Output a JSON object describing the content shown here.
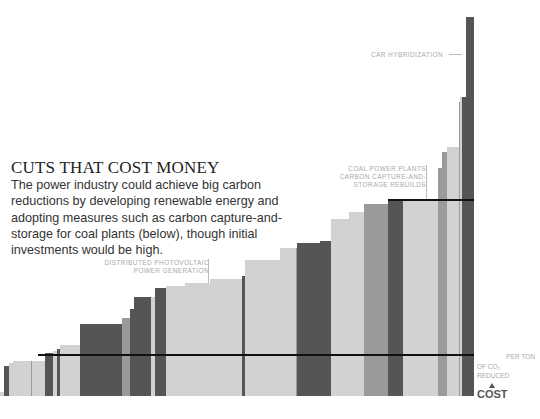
{
  "header": {
    "title": "CUTS THAT COST MONEY",
    "body": "The power industry could achieve big carbon reductions by developing renewable energy and adopting measures such as carbon capture-and-storage for coal plants (below), though initial investments would be high."
  },
  "annotations": {
    "car_hybridization": "CAR HYBRIDIZATION",
    "coal_line1": "COAL POWER PLANTS",
    "coal_line2": "CARBON CAPTURE-AND-",
    "coal_line3": "STORAGE REBUILDS",
    "pv_line1": "DISTRIBUTED PHOTOVOLTAIC",
    "pv_line2": "POWER GENERATION",
    "per_ton_line1": "PER TON",
    "per_ton_line2": "OF CO₂",
    "per_ton_line3": "REDUCED",
    "cost_label": "COST"
  },
  "colors": {
    "light": "#d2d2d2",
    "mid": "#9a9a9a",
    "dark": "#555555",
    "line": "#111111"
  },
  "chart_data": {
    "type": "bar",
    "subtype": "step (marginal abatement cost curve)",
    "title": "CUTS THAT COST MONEY",
    "xlabel": "",
    "ylabel": "COST per ton of CO2 reduced",
    "grid": false,
    "legend": "none",
    "bars_px": [
      {
        "x0": 0,
        "x1": 4,
        "top": 392,
        "shade": "light"
      },
      {
        "x0": 4,
        "x1": 9,
        "top": 366,
        "shade": "dark"
      },
      {
        "x0": 9,
        "x1": 13,
        "top": 363,
        "shade": "light"
      },
      {
        "x0": 13,
        "x1": 31,
        "top": 361,
        "shade": "light"
      },
      {
        "x0": 31,
        "x1": 32,
        "top": 361,
        "shade": "mid"
      },
      {
        "x0": 32,
        "x1": 45,
        "top": 361,
        "shade": "light"
      },
      {
        "x0": 45,
        "x1": 53,
        "top": 353,
        "shade": "dark"
      },
      {
        "x0": 53,
        "x1": 57,
        "top": 351,
        "shade": "light"
      },
      {
        "x0": 57,
        "x1": 60,
        "top": 349,
        "shade": "dark"
      },
      {
        "x0": 60,
        "x1": 80,
        "top": 345,
        "shade": "light"
      },
      {
        "x0": 80,
        "x1": 122,
        "top": 324,
        "shade": "dark"
      },
      {
        "x0": 122,
        "x1": 130,
        "top": 318,
        "shade": "mid"
      },
      {
        "x0": 130,
        "x1": 134,
        "top": 309,
        "shade": "dark"
      },
      {
        "x0": 134,
        "x1": 151,
        "top": 297,
        "shade": "dark"
      },
      {
        "x0": 151,
        "x1": 155,
        "top": 297,
        "shade": "light"
      },
      {
        "x0": 155,
        "x1": 166,
        "top": 288,
        "shade": "dark"
      },
      {
        "x0": 166,
        "x1": 185,
        "top": 286,
        "shade": "light"
      },
      {
        "x0": 185,
        "x1": 210,
        "top": 283,
        "shade": "light"
      },
      {
        "x0": 210,
        "x1": 242,
        "top": 279,
        "shade": "light"
      },
      {
        "x0": 242,
        "x1": 245,
        "top": 276,
        "shade": "dark"
      },
      {
        "x0": 245,
        "x1": 280,
        "top": 260,
        "shade": "light"
      },
      {
        "x0": 280,
        "x1": 296,
        "top": 248,
        "shade": "light"
      },
      {
        "x0": 296,
        "x1": 297,
        "top": 248,
        "shade": "mid"
      },
      {
        "x0": 297,
        "x1": 320,
        "top": 243,
        "shade": "dark"
      },
      {
        "x0": 320,
        "x1": 331,
        "top": 241,
        "shade": "dark"
      },
      {
        "x0": 331,
        "x1": 349,
        "top": 219,
        "shade": "light"
      },
      {
        "x0": 349,
        "x1": 364,
        "top": 212,
        "shade": "light"
      },
      {
        "x0": 364,
        "x1": 388,
        "top": 204,
        "shade": "mid"
      },
      {
        "x0": 388,
        "x1": 403,
        "top": 201,
        "shade": "dark"
      },
      {
        "x0": 403,
        "x1": 438,
        "top": 201,
        "shade": "light"
      },
      {
        "x0": 438,
        "x1": 442,
        "top": 168,
        "shade": "mid"
      },
      {
        "x0": 442,
        "x1": 447,
        "top": 152,
        "shade": "mid"
      },
      {
        "x0": 447,
        "x1": 459,
        "top": 147,
        "shade": "light"
      },
      {
        "x0": 459,
        "x1": 460,
        "top": 102,
        "shade": "mid"
      },
      {
        "x0": 460,
        "x1": 462,
        "top": 97,
        "shade": "light"
      },
      {
        "x0": 462,
        "x1": 466,
        "top": 97,
        "shade": "dark"
      },
      {
        "x0": 466,
        "x1": 474,
        "top": 17,
        "shade": "dark"
      }
    ],
    "reference_lines_px": [
      {
        "y": 355,
        "x0": 38,
        "x1": 474
      },
      {
        "y": 200,
        "x0": 388,
        "x1": 474
      }
    ]
  }
}
